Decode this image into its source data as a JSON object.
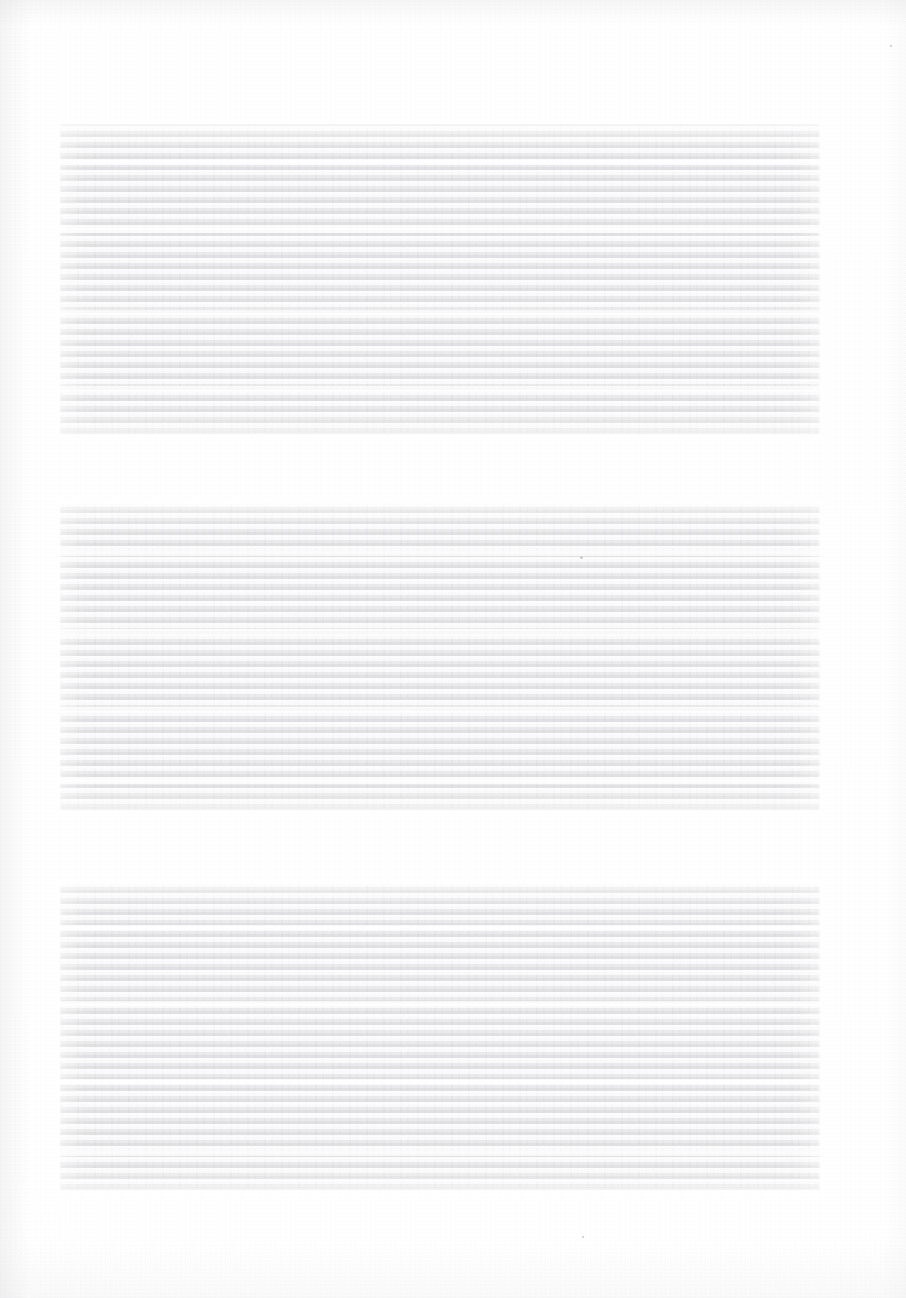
{
  "document": {
    "type": "scanned-page",
    "page_width": 906,
    "page_height": 1298,
    "background_color": "#fefefe",
    "paper_tone": "#fdfdfd",
    "legible_text": "",
    "note": ""
  },
  "blocks": [
    {
      "id": "text-block-1",
      "label": "",
      "x": 60,
      "y": 124,
      "width": 760,
      "height": 312,
      "fill_color": "#ededee"
    },
    {
      "id": "text-block-2",
      "label": "",
      "x": 60,
      "y": 503,
      "width": 760,
      "height": 309,
      "fill_color": "#ededee"
    },
    {
      "id": "text-block-3",
      "label": "",
      "x": 60,
      "y": 883,
      "width": 760,
      "height": 309,
      "fill_color": "#ededee"
    }
  ],
  "specks": [
    {
      "x": 580,
      "y": 556,
      "size": 3
    },
    {
      "x": 890,
      "y": 45,
      "size": 2
    },
    {
      "x": 582,
      "y": 1236,
      "size": 2
    }
  ]
}
